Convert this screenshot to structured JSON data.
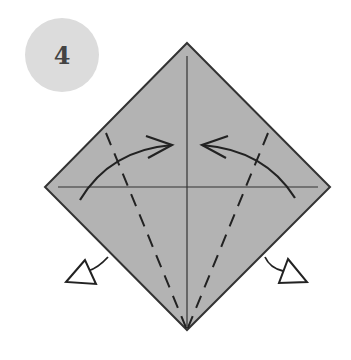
{
  "step": {
    "number": "4",
    "badge_color": "#dcdcdc",
    "number_color": "#444444"
  },
  "diagram": {
    "paper_fill": "#b3b3b3",
    "outline_color": "#333333",
    "shapes": {
      "diamond": {
        "top": [
          187,
          43
        ],
        "right": [
          330,
          187
        ],
        "bottom": [
          187,
          330
        ],
        "left": [
          45,
          187
        ]
      },
      "center_crease_vertical": {
        "from": [
          187,
          56
        ],
        "to": [
          187,
          326
        ]
      },
      "center_crease_horizontal": {
        "from": [
          58,
          187
        ],
        "to": [
          318,
          187
        ]
      },
      "valley_fold_left": {
        "from": [
          106,
          133
        ],
        "to": [
          187,
          330
        ],
        "style": "dashed"
      },
      "valley_fold_right": {
        "from": [
          268,
          133
        ],
        "to": [
          187,
          330
        ],
        "style": "dashed"
      },
      "fold_arrow_left": {
        "from": [
          80,
          200
        ],
        "to": [
          172,
          145
        ],
        "direction": "right"
      },
      "fold_arrow_right": {
        "from": [
          295,
          198
        ],
        "to": [
          202,
          145
        ],
        "direction": "left"
      },
      "push_arrow_left": {
        "at": [
          66,
          282
        ],
        "style": "hollow"
      },
      "push_arrow_right": {
        "at": [
          296,
          282
        ],
        "style": "hollow"
      }
    }
  },
  "caption": {
    "text": "",
    "note": "caption text below diagram is cropped off at the bottom edge"
  }
}
